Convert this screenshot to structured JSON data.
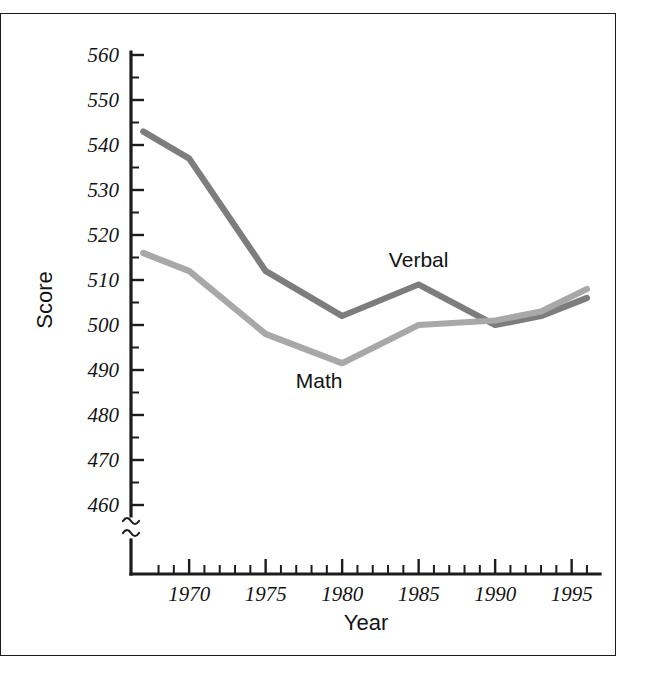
{
  "figure": {
    "frame_color": "#1c1c1c",
    "background": "#ffffff"
  },
  "chart_data": {
    "type": "line",
    "title": "",
    "xlabel": "Year",
    "ylabel": "Score",
    "xlim": [
      1966,
      1997
    ],
    "ylim": [
      455,
      560
    ],
    "y_axis_break": true,
    "y_break_symbol": "≈",
    "grid": false,
    "legend_position": "inline-annotations",
    "x_ticks_major": [
      1970,
      1975,
      1980,
      1985,
      1990,
      1995
    ],
    "x_tick_labels": [
      "1970",
      "1975",
      "1980",
      "1985",
      "1990",
      "1995"
    ],
    "x_tick_minor_step": 1,
    "y_ticks_major": [
      460,
      470,
      480,
      490,
      500,
      510,
      520,
      530,
      540,
      550,
      560
    ],
    "y_tick_labels": [
      "460",
      "470",
      "480",
      "490",
      "500",
      "510",
      "520",
      "530",
      "540",
      "550",
      "560"
    ],
    "y_tick_minor_step": 5,
    "series": [
      {
        "name": "Verbal",
        "label": "Verbal",
        "color": "#7d7d7d",
        "x": [
          1967,
          1970,
          1975,
          1980,
          1985,
          1990,
          1993,
          1996
        ],
        "values": [
          543,
          537,
          512,
          502,
          509,
          500,
          502,
          506
        ]
      },
      {
        "name": "Math",
        "label": "Math",
        "color": "#a8a8a8",
        "x": [
          1967,
          1970,
          1975,
          1980,
          1985,
          1990,
          1993,
          1996
        ],
        "values": [
          516,
          512,
          498,
          491.5,
          500,
          501,
          503,
          508
        ]
      }
    ],
    "annotations": [
      {
        "text": "Verbal",
        "x": 1985,
        "y": 513
      },
      {
        "text": "Math",
        "x": 1978.5,
        "y": 486
      }
    ]
  }
}
